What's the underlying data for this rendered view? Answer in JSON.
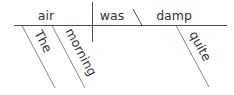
{
  "diagram": {
    "type": "sentence-diagram",
    "sentence": "The morning air was quite damp",
    "subject": "air",
    "verb": "was",
    "predicate_adjective": "damp",
    "modifiers": [
      {
        "word": "The",
        "modifies": "air"
      },
      {
        "word": "morning",
        "modifies": "air"
      },
      {
        "word": "quite",
        "modifies": "damp"
      }
    ]
  },
  "colors": {
    "line": "#3a3a3a",
    "text": "#333333",
    "background": "#ffffff"
  }
}
